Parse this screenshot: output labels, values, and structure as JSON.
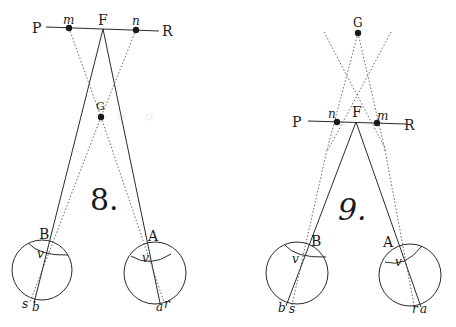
{
  "figures": [
    {
      "id": "fig8",
      "number_label": "8.",
      "labels": {
        "P": "P",
        "R": "R",
        "F": "F",
        "G": "G",
        "m": "m",
        "n": "n",
        "A": "A",
        "B": "B",
        "v_left": "v",
        "v_right": "v",
        "s": "s",
        "b": "b",
        "a": "a",
        "r": "r"
      }
    },
    {
      "id": "fig9",
      "number_label": "9.",
      "labels": {
        "P": "P",
        "R": "R",
        "F": "F",
        "G": "G",
        "m": "m",
        "n": "n",
        "A": "A",
        "B": "B",
        "v_left": "v",
        "v_right": "v",
        "s": "s",
        "b": "b",
        "a": "a",
        "r": "r"
      }
    }
  ],
  "colors": {
    "ink": "#1a1a1a",
    "dotted": "#555555",
    "background": "#ffffff"
  }
}
